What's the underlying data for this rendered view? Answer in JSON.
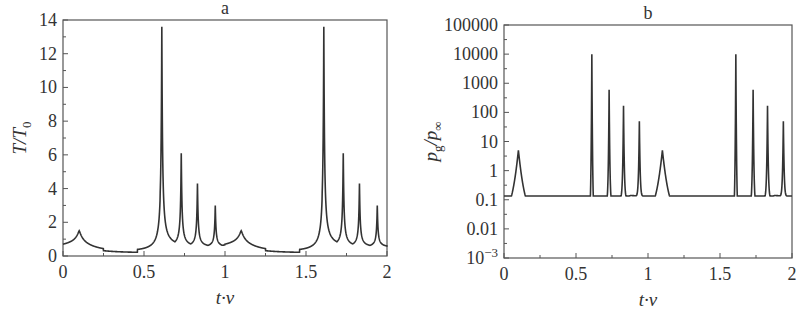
{
  "chart_data": [
    {
      "type": "line",
      "title": "a",
      "xlabel": "t·ν",
      "ylabel": "T/T0",
      "xlim": [
        0,
        2
      ],
      "ylim": [
        0,
        14
      ],
      "xticks": [
        "0",
        "0.5",
        "1",
        "1.5",
        "2"
      ],
      "yticks": [
        "0",
        "2",
        "4",
        "6",
        "8",
        "10",
        "12",
        "14"
      ],
      "grid": false,
      "yscale": "linear",
      "peaks": [
        {
          "x": 0.1,
          "y": 1.5
        },
        {
          "x": 0.61,
          "y": 13.6
        },
        {
          "x": 0.73,
          "y": 6.1
        },
        {
          "x": 0.83,
          "y": 4.3
        },
        {
          "x": 0.94,
          "y": 3.0
        },
        {
          "x": 1.1,
          "y": 1.5
        },
        {
          "x": 1.61,
          "y": 13.6
        },
        {
          "x": 1.73,
          "y": 6.1
        },
        {
          "x": 1.83,
          "y": 4.3
        },
        {
          "x": 1.94,
          "y": 3.0
        }
      ],
      "baseline": {
        "start": 0.55,
        "min": 0.2,
        "min_x": 0.55,
        "between_peaks": 0.5
      }
    },
    {
      "type": "line",
      "title": "b",
      "xlabel": "t·ν",
      "ylabel": "pg/p∞",
      "xlim": [
        0,
        2
      ],
      "ylim": [
        0.001,
        100000
      ],
      "xticks": [
        "0",
        "0.5",
        "1",
        "1.5",
        "2"
      ],
      "yticks": [
        "10^-3",
        "0.01",
        "0.1",
        "1",
        "10",
        "100",
        "1000",
        "10000",
        "100000"
      ],
      "grid": false,
      "yscale": "log",
      "peaks": [
        {
          "x": 0.1,
          "y": 5
        },
        {
          "x": 0.61,
          "y": 10000
        },
        {
          "x": 0.73,
          "y": 600
        },
        {
          "x": 0.83,
          "y": 170
        },
        {
          "x": 0.94,
          "y": 50
        },
        {
          "x": 1.1,
          "y": 5
        },
        {
          "x": 1.61,
          "y": 10000
        },
        {
          "x": 1.73,
          "y": 600
        },
        {
          "x": 1.83,
          "y": 170
        },
        {
          "x": 1.94,
          "y": 50
        }
      ],
      "troughs": [
        {
          "x": 0.0,
          "y": 0.12
        },
        {
          "x": 0.48,
          "y": 0.004
        },
        {
          "x": 0.67,
          "y": 0.05
        },
        {
          "x": 0.78,
          "y": 0.1
        },
        {
          "x": 0.88,
          "y": 0.14
        },
        {
          "x": 1.0,
          "y": 0.13
        },
        {
          "x": 1.48,
          "y": 0.004
        },
        {
          "x": 1.67,
          "y": 0.05
        },
        {
          "x": 1.78,
          "y": 0.1
        },
        {
          "x": 1.88,
          "y": 0.14
        },
        {
          "x": 2.0,
          "y": 0.13
        }
      ]
    }
  ]
}
